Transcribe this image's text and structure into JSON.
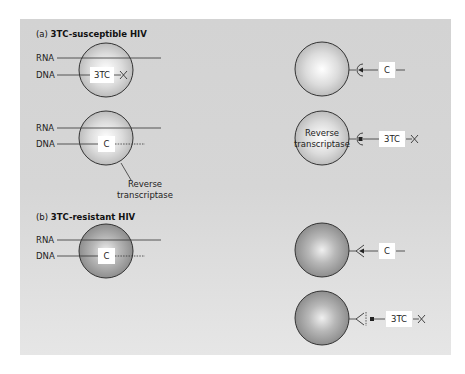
{
  "panel_a": {
    "title_prefix": "(a)",
    "title": "3TC-susceptible HIV",
    "row1": {
      "rna_label": "RNA",
      "dna_label": "DNA",
      "box_label": "3TC",
      "terminator": "×"
    },
    "row2": {
      "rna_label": "RNA",
      "dna_label": "DNA",
      "box_label": "C",
      "enzyme_label_line1": "Reverse",
      "enzyme_label_line2": "transcriptase"
    },
    "right1": {
      "box_label": "C"
    },
    "right2": {
      "enzyme_label_line1": "Reverse",
      "enzyme_label_line2": "transcriptase",
      "box_label": "3TC",
      "terminator": "×"
    }
  },
  "panel_b": {
    "title_prefix": "(b)",
    "title": "3TC-resistant HIV",
    "row1": {
      "rna_label": "RNA",
      "dna_label": "DNA",
      "box_label": "C"
    },
    "right1": {
      "box_label": "C"
    },
    "right2": {
      "box_label": "3TC",
      "terminator": "×"
    }
  },
  "colors": {
    "panel_bg": "#d4d4d4",
    "susceptible_sphere_center": "#ffffff",
    "susceptible_sphere_edge": "#b5b5b5",
    "resistant_sphere_center": "#e8e8e8",
    "resistant_sphere_edge": "#8a8a8a",
    "stroke": "#333333",
    "box_fill": "#ffffff"
  }
}
